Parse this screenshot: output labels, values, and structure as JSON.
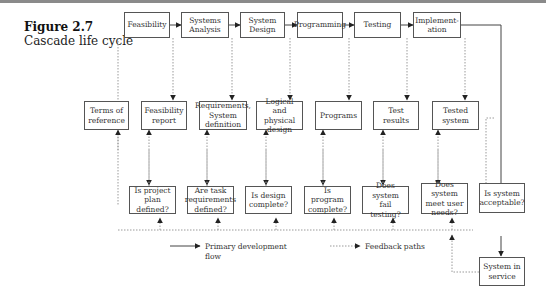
{
  "figure": {
    "number": "Figure 2.7",
    "title": "Cascade life cycle"
  },
  "phases": [
    {
      "id": "feasibility",
      "label": "Feasibility"
    },
    {
      "id": "systems-analysis",
      "label": "Systems\nAnalysis"
    },
    {
      "id": "system-design",
      "label": "System\nDesign"
    },
    {
      "id": "programming",
      "label": "Programming"
    },
    {
      "id": "testing",
      "label": "Testing"
    },
    {
      "id": "implementation",
      "label": "Implement-\nation"
    }
  ],
  "deliverables": [
    {
      "id": "terms-of-reference",
      "label": "Terms of\nreference"
    },
    {
      "id": "feasibility-report",
      "label": "Feasibility\nreport"
    },
    {
      "id": "requirements",
      "label": "Requirements,\nSystem\ndefinition"
    },
    {
      "id": "logical-physical-design",
      "label": "Logical and\nphysical\ndesign"
    },
    {
      "id": "programs",
      "label": "Programs"
    },
    {
      "id": "test-results",
      "label": "Test results"
    },
    {
      "id": "tested-system",
      "label": "Tested system"
    }
  ],
  "checks": [
    {
      "id": "project-plan-defined",
      "label": "Is project\nplan defined?"
    },
    {
      "id": "task-requirements-defined",
      "label": "Are task\nrequirements\ndefined?"
    },
    {
      "id": "design-complete",
      "label": "Is design\ncomplete?"
    },
    {
      "id": "program-complete",
      "label": "Is program\ncomplete?"
    },
    {
      "id": "system-fail-testing",
      "label": "Does system\nfail testing?"
    },
    {
      "id": "meet-user-needs",
      "label": "Does system\nmeet user\nneeds?"
    },
    {
      "id": "system-acceptable",
      "label": "Is system\nacceptable?"
    }
  ],
  "final": {
    "id": "system-in-service",
    "label": "System in\nservice"
  },
  "legend": {
    "primary": "Primary development\nflow",
    "feedback": "Feedback paths"
  },
  "colors": {
    "box_border": "#555555",
    "solid_line": "#444444",
    "dotted_line": "#9a9a9a",
    "top_rule": "#8a8a8a"
  }
}
